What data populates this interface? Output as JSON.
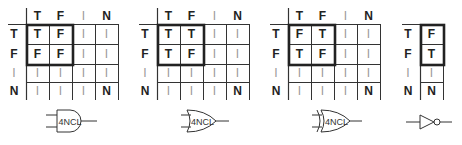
{
  "figure": {
    "tables": [
      {
        "name": "and",
        "col_headers": [
          "T",
          "F",
          "I",
          "N"
        ],
        "row_headers": [
          "T",
          "F",
          "I",
          "N"
        ],
        "cells": [
          [
            "T",
            "F",
            "I",
            "I"
          ],
          [
            "F",
            "F",
            "I",
            "I"
          ],
          [
            "I",
            "I",
            "I",
            "I"
          ],
          [
            "I",
            "I",
            "I",
            "N"
          ]
        ],
        "gate_label": "4NCL",
        "gate_type": "and-gate"
      },
      {
        "name": "or",
        "col_headers": [
          "T",
          "F",
          "I",
          "N"
        ],
        "row_headers": [
          "T",
          "F",
          "I",
          "N"
        ],
        "cells": [
          [
            "T",
            "T",
            "I",
            "I"
          ],
          [
            "T",
            "F",
            "I",
            "I"
          ],
          [
            "I",
            "I",
            "I",
            "I"
          ],
          [
            "I",
            "I",
            "I",
            "N"
          ]
        ],
        "gate_label": "4NCL",
        "gate_type": "or-gate"
      },
      {
        "name": "xor",
        "col_headers": [
          "T",
          "F",
          "I",
          "N"
        ],
        "row_headers": [
          "T",
          "F",
          "I",
          "N"
        ],
        "cells": [
          [
            "F",
            "T",
            "I",
            "I"
          ],
          [
            "T",
            "F",
            "I",
            "I"
          ],
          [
            "I",
            "I",
            "I",
            "I"
          ],
          [
            "I",
            "I",
            "I",
            "N"
          ]
        ],
        "gate_label": "4NCL",
        "gate_type": "xor-gate"
      },
      {
        "name": "not",
        "col_headers": [],
        "row_headers": [
          "T",
          "F",
          "I",
          "N"
        ],
        "cells": [
          [
            "F"
          ],
          [
            "T"
          ],
          [
            "I"
          ],
          [
            "N"
          ]
        ],
        "gate_label": "",
        "gate_type": "not-gate"
      }
    ],
    "colors": {
      "line": "#333333",
      "thick": "#222222",
      "dim_text": "#9a9a9a",
      "text": "#222222"
    }
  }
}
